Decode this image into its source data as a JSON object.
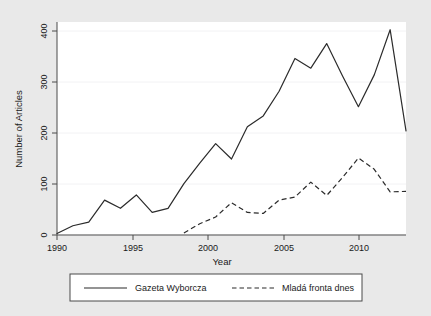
{
  "chart_data": {
    "type": "line",
    "title": "",
    "xlabel": "Year",
    "ylabel": "Number of Articles",
    "xlim": [
      1990,
      2012
    ],
    "ylim": [
      0,
      415
    ],
    "xticks": [
      1990,
      1995,
      2000,
      2005,
      2010
    ],
    "xtick_labels": [
      "1990",
      "1995",
      "2000",
      "2005",
      "2010"
    ],
    "yticks": [
      0,
      100,
      200,
      300,
      400
    ],
    "ytick_labels": [
      "0",
      "100",
      "200",
      "300",
      "400"
    ],
    "grid": true,
    "legend_position": "below-plot",
    "series": [
      {
        "name": "Gazeta Wyborcza",
        "style": "solid",
        "color": "#2b2b2b",
        "x": [
          1990,
          1991,
          1992,
          1993,
          1994,
          1995,
          1996,
          1997,
          1998,
          1999,
          2000,
          2001,
          2002,
          2003,
          2004,
          2005,
          2006,
          2007,
          2008,
          2009,
          2010,
          2011,
          2012
        ],
        "values": [
          3,
          18,
          25,
          68,
          52,
          78,
          44,
          52,
          100,
          140,
          178,
          148,
          211,
          232,
          280,
          344,
          325,
          373,
          310,
          250,
          312,
          400,
          203
        ]
      },
      {
        "name": "Mladá fronta dnes",
        "style": "dashed",
        "color": "#2b2b2b",
        "x": [
          1998,
          1999,
          2000,
          2001,
          2002,
          2003,
          2004,
          2005,
          2006,
          2007,
          2008,
          2009,
          2010,
          2011,
          2012
        ],
        "values": [
          4,
          22,
          35,
          63,
          44,
          42,
          68,
          74,
          103,
          77,
          112,
          150,
          128,
          84,
          85
        ]
      }
    ]
  },
  "legend": {
    "entries": [
      {
        "label": "Gazeta Wyborcza",
        "style": "solid"
      },
      {
        "label": "Mladá fronta dnes",
        "style": "dashed"
      }
    ]
  }
}
